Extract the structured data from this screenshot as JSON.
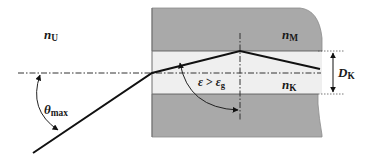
{
  "diagram": {
    "colors": {
      "cladding": "#a9a9a9",
      "core": "#efefef",
      "background": "#ffffff",
      "ray": "#111111",
      "axis": "#333333"
    },
    "regions": {
      "outer_medium": {
        "symbol": "n",
        "subscript": "U"
      },
      "cladding": {
        "symbol": "n",
        "subscript": "M"
      },
      "core": {
        "symbol": "n",
        "subscript": "K"
      }
    },
    "dimension": {
      "symbol": "D",
      "subscript": "K"
    },
    "angles": {
      "acceptance": {
        "symbol": "θ",
        "subscript": "max"
      },
      "reflection": {
        "symbol": "ε",
        "relation": ">",
        "compare_symbol": "ε",
        "compare_subscript": "g"
      }
    }
  }
}
